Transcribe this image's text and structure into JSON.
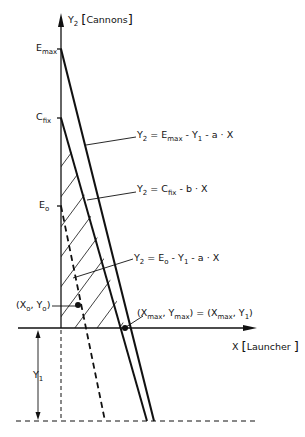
{
  "diagram": {
    "y_axis": {
      "var": "Y",
      "sub": "2",
      "unit": "Cannons"
    },
    "x_axis": {
      "var": "X",
      "unit": "Launcher"
    },
    "ticks": {
      "emax": {
        "base": "E",
        "sub": "max"
      },
      "cfix": {
        "base": "C",
        "sub": "fix"
      },
      "eo": {
        "base": "E",
        "sub": "o"
      }
    },
    "equations": [
      {
        "id": "eq-emax",
        "lhs": "Y",
        "lhs_sub": "2",
        "text": "= E",
        "t1_sub": "max",
        "rest1": " - Y",
        "rest1_sub": "1",
        "rest2": " - a · X"
      },
      {
        "id": "eq-cfix",
        "lhs": "Y",
        "lhs_sub": "2",
        "text": "= C",
        "t1_sub": "fix",
        "rest1": " - b · X"
      },
      {
        "id": "eq-eo",
        "lhs": "Y",
        "lhs_sub": "2",
        "text": "= E",
        "t1_sub": "o",
        "rest1": " - Y",
        "rest1_sub": "1",
        "rest2": " - a · X"
      }
    ],
    "points": {
      "xo_yo": {
        "open": "(X",
        "sub1": "o",
        "mid": ", Y",
        "sub2": "o",
        "close": ")"
      },
      "xmax_ymax": {
        "p1": "(X",
        "s1": "max",
        "p2": ", Y",
        "s2": "max",
        "p3": ") = (X",
        "s3": "max",
        "p4": ", Y",
        "s4": "1",
        "p5": ")"
      }
    },
    "y1_label": {
      "base": "Y",
      "sub": "1"
    },
    "colors": {
      "ink": "#111111",
      "background": "#ffffff"
    }
  }
}
